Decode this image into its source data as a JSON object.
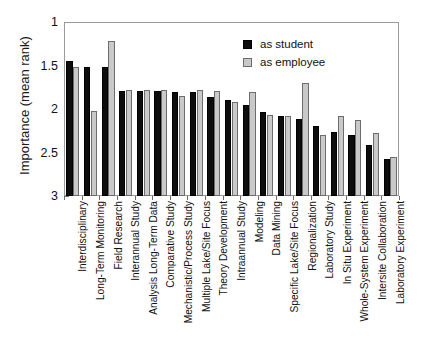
{
  "chart_data": {
    "type": "bar",
    "title": "",
    "xlabel": "",
    "ylabel": "Importance (mean rank)",
    "ylim": [
      1,
      3
    ],
    "y_inverted": true,
    "yticks": [
      1,
      1.5,
      2,
      2.5,
      3
    ],
    "ytick_labels": [
      "1",
      "1.5",
      "2",
      "2.5",
      "3"
    ],
    "grid": false,
    "legend_position": "top-right",
    "categories": [
      "Interdisciplinary",
      "Long-Term Monitoring",
      "Field Research",
      "Interannual Study",
      "Analysis Long-Term Data",
      "Comparative Study",
      "Mechanistic/Process Study",
      "Multiple Lake/Site Focus",
      "Theory Development",
      "Intraannual Study",
      "Modeling",
      "Data Mining",
      "Specific Lake/Site Focus",
      "Regionalization",
      "Laboratory Study",
      "In Situ Experiment",
      "Whole-System Experiment",
      "Intersite Collaboration",
      "Laboratory Experiment"
    ],
    "series": [
      {
        "name": "as student",
        "color": "#0d0d0d",
        "values": [
          1.45,
          1.52,
          1.52,
          1.79,
          1.79,
          1.79,
          1.81,
          1.81,
          1.86,
          1.9,
          1.95,
          2.03,
          2.08,
          2.11,
          2.19,
          2.26,
          2.3,
          2.41,
          2.57
        ]
      },
      {
        "name": "as employee",
        "color": "#c9c9c9",
        "values": [
          1.52,
          2.02,
          1.22,
          1.78,
          1.78,
          1.78,
          1.85,
          1.78,
          1.79,
          1.92,
          1.81,
          2.07,
          2.08,
          1.7,
          2.3,
          2.08,
          2.13,
          2.28,
          2.55
        ]
      }
    ]
  },
  "legend": {
    "items": [
      {
        "label": "as student",
        "swatch": "student"
      },
      {
        "label": "as employee",
        "swatch": "employee"
      }
    ]
  }
}
